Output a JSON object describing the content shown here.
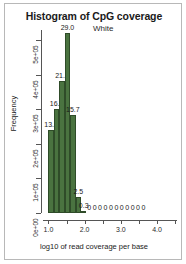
{
  "chart_data": {
    "type": "bar",
    "title": "Histogram of CpG coverage",
    "subtitle": "White",
    "xlabel": "log10 of read coverage per base",
    "ylabel": "Frequency",
    "xlim": [
      0.85,
      4.55
    ],
    "ylim": [
      0,
      530000
    ],
    "grid": false,
    "legend": "none",
    "bar_color": "#4a7340",
    "bar_edge_color": "#2f4c29",
    "bin_width": 0.15,
    "x_ticks": [
      "1.0",
      "2.0",
      "3.0",
      "4.0"
    ],
    "x_tick_values": [
      1.0,
      2.0,
      3.0,
      4.0
    ],
    "x_minor_tick_values": [
      1.5,
      2.5,
      3.5,
      4.5
    ],
    "y_ticks": [
      "0e+00",
      "1e+05",
      "2e+05",
      "3e+05",
      "4e+05",
      "5e+05"
    ],
    "y_tick_values": [
      0,
      100000,
      200000,
      300000,
      400000,
      500000
    ],
    "bins": [
      {
        "x": 1.075,
        "value": 239000,
        "label": "13.3"
      },
      {
        "x": 1.225,
        "value": 300000,
        "label": "16.7"
      },
      {
        "x": 1.375,
        "value": 383000,
        "label": "21.3"
      },
      {
        "x": 1.525,
        "value": 522000,
        "label": "29.0"
      },
      {
        "x": 1.675,
        "value": 283000,
        "label": "15.7"
      },
      {
        "x": 1.825,
        "value": 45000,
        "label": "2.5"
      },
      {
        "x": 1.975,
        "value": 5400,
        "label": "0.3"
      },
      {
        "x": 2.125,
        "value": 0,
        "label": "0"
      },
      {
        "x": 2.275,
        "value": 0,
        "label": "0"
      },
      {
        "x": 2.425,
        "value": 0,
        "label": "0"
      },
      {
        "x": 2.575,
        "value": 0,
        "label": "0"
      },
      {
        "x": 2.725,
        "value": 0,
        "label": "0"
      },
      {
        "x": 2.875,
        "value": 0,
        "label": "0"
      },
      {
        "x": 3.025,
        "value": 0,
        "label": "0"
      },
      {
        "x": 3.175,
        "value": 0,
        "label": "0"
      },
      {
        "x": 3.325,
        "value": 0,
        "label": "0"
      },
      {
        "x": 3.475,
        "value": 0,
        "label": "0"
      },
      {
        "x": 3.625,
        "value": 0,
        "label": "0"
      }
    ]
  }
}
